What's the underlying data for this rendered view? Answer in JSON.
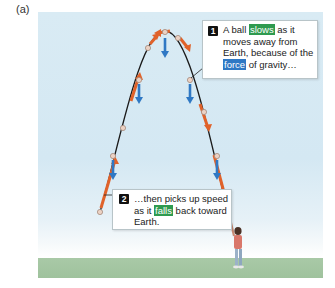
{
  "figure": {
    "panel_label": "(a)",
    "colors": {
      "sky_top": "#d9ebf4",
      "ground": "#a9c9a7",
      "trajectory": "#1a1a1a",
      "velocity_arrow": "#e0622a",
      "force_arrow": "#2f78c4",
      "ball": "#e8c8b8",
      "highlight_green": "#2f9a4f",
      "highlight_blue": "#2f78c4"
    },
    "callout_1": {
      "number": "1",
      "text_before": "A ball ",
      "highlight_1": "slows",
      "text_middle": " as it moves away from Earth, because of the ",
      "highlight_2": "force",
      "text_after": " of gravity…"
    },
    "callout_2": {
      "number": "2",
      "text_before": "…then picks up speed as it ",
      "highlight_1": "falls",
      "text_after": " back toward Earth."
    }
  }
}
